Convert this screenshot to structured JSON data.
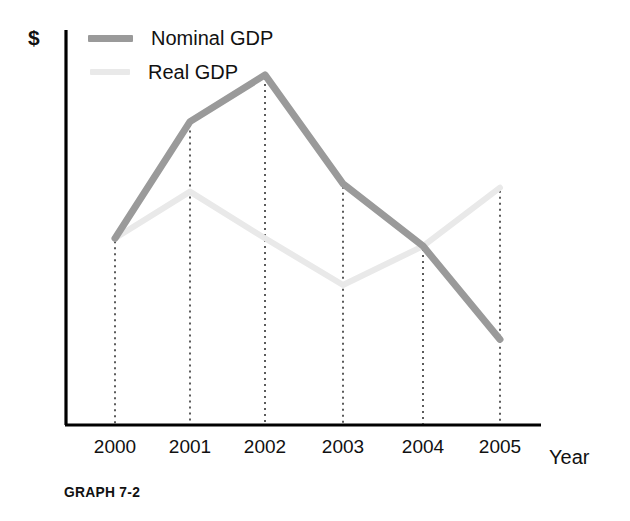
{
  "chart_data": {
    "type": "line",
    "title": "",
    "caption": "GRAPH 7-2",
    "xlabel": "Year",
    "ylabel": "$",
    "categories": [
      "2000",
      "2001",
      "2002",
      "2003",
      "2004",
      "2005"
    ],
    "x": [
      2000,
      2001,
      2002,
      2003,
      2004,
      2005
    ],
    "grid": false,
    "grid_style": "dotted vertical drop-lines from each data point to x-axis",
    "axis_ticks_y": [],
    "ylim": [
      0,
      100
    ],
    "y_axis_unlabeled": true,
    "legend_position": "top-left inside plot",
    "series": [
      {
        "name": "Nominal GDP",
        "color": "#9a9a9a",
        "line_width": 7,
        "values": [
          48,
          78,
          90,
          62,
          46,
          22
        ]
      },
      {
        "name": "Real GDP",
        "color": "#e9e9e9",
        "line_width": 6,
        "values": [
          48,
          60,
          48,
          36,
          46,
          61
        ]
      }
    ],
    "notes": [
      "Nominal GDP rises from 2000 to a peak at 2002, then falls steadily through 2005.",
      "Real GDP peaks at 2001, dips to a trough at 2003, then rises through 2005.",
      "Both series share the same starting value at 2000.",
      "The two lines cross between 2003 and 2004."
    ]
  },
  "axes": {
    "y_title": "$",
    "x_title": "Year",
    "axis_color": "#000000"
  },
  "legend": {
    "items": [
      {
        "label": "Nominal GDP",
        "swatch": "nominal"
      },
      {
        "label": "Real GDP",
        "swatch": "real"
      }
    ]
  },
  "caption": {
    "text": "GRAPH 7-2"
  }
}
